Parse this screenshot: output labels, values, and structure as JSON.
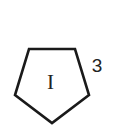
{
  "diagram": {
    "shape": {
      "type": "pentagon",
      "orientation": "inverted",
      "stroke_color": "#1a1a1a",
      "fill_color": "#ffffff",
      "points": "29,49 75,49 89,95 52,123 15,95",
      "label": "I"
    },
    "annotation": {
      "text": "3",
      "position": "right of top-right vertex"
    }
  }
}
